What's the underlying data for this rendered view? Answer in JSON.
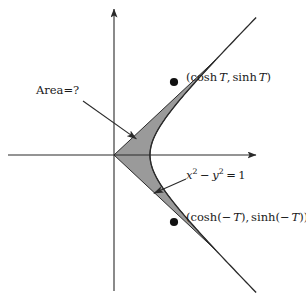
{
  "figure": {
    "kind": "hyperbola-sector-diagram",
    "width": 306,
    "height": 297,
    "background_color": "#ffffff",
    "stroke_color": "#2a2a2a",
    "shade_fill_color": "#9a9a9a",
    "shade_stroke_color": "#2a2a2a",
    "point_marker_color": "#111111"
  },
  "axes": {
    "x_axis": {
      "name": "x-axis",
      "from_x": 8,
      "to_x": 259,
      "y": 155,
      "arrowhead": "right"
    },
    "y_axis": {
      "name": "y-axis",
      "x": 114,
      "from_y": 291,
      "to_y": 6,
      "arrowhead": "up"
    },
    "origin": {
      "x": 114,
      "y": 155
    },
    "unit_pixels": 36
  },
  "curve": {
    "name": "hyperbola-right-branch",
    "equation_text": "x^2 - y^2 = 1",
    "vertex": {
      "x": 1,
      "y": 0
    },
    "t_range": [
      -2.05,
      2.05
    ]
  },
  "sector": {
    "name": "hyperbolic-sector",
    "description": "region bounded by two rays from the origin and the hyperbola arc",
    "t_parameter": 1.7
  },
  "points": [
    {
      "id": "point-positive-t",
      "label": "(cosh T, sinh T)",
      "cosh_text": "cosh",
      "sinh_text": "sinh",
      "arg_text": "T",
      "px": 174,
      "py": 82
    },
    {
      "id": "point-negative-t",
      "label": "(cosh(-T), sinh(-T))",
      "cosh_text": "cosh",
      "sinh_text": "sinh",
      "arg_text": "-T",
      "px": 174,
      "py": 222
    }
  ],
  "labels": {
    "point_positive": {
      "full_text": "(cosh T, sinh T)",
      "open_paren": "(",
      "cosh": "cosh",
      "var": "T",
      "comma": ",",
      "sinh": "sinh",
      "close_paren": ")"
    },
    "point_negative": {
      "full_text": "(cosh(-T), sinh(-T))",
      "open_paren": "(",
      "cosh": "cosh",
      "inner_open": "(",
      "minus": "−",
      "var": "T",
      "inner_close": ")",
      "comma": ",",
      "sinh": "sinh",
      "close_paren": ")"
    },
    "curve_equation": {
      "full_text": "x² − y² = 1",
      "x_var": "x",
      "x_exp": "2",
      "minus": "−",
      "y_var": "y",
      "y_exp": "2",
      "equals": "=",
      "rhs": "1"
    },
    "area_question": {
      "full_text": "Area=?",
      "word": "Area",
      "equals": "=",
      "question": "?"
    }
  },
  "leaders": [
    {
      "id": "leader-area",
      "from": {
        "x": 83,
        "y": 101
      },
      "to": {
        "x": 138,
        "y": 140
      },
      "arrowhead_at": "to"
    },
    {
      "id": "leader-equation",
      "from": {
        "x": 186,
        "y": 179
      },
      "to": {
        "x": 152,
        "y": 194
      },
      "arrowhead_at": "to"
    }
  ]
}
